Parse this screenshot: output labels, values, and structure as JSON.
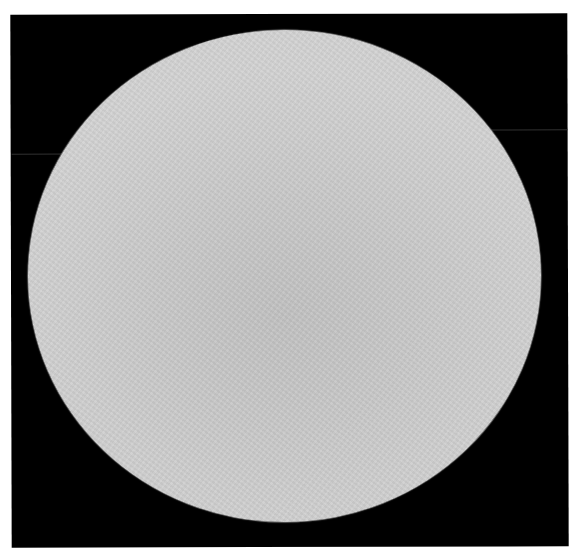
{
  "image": {
    "kind": "grayscale photograph",
    "subject": "light gray circular disc on black square background",
    "background_color": "#ffffff",
    "frame": {
      "color": "#000000",
      "left": 11,
      "top": 14,
      "width": 557,
      "height": 533
    },
    "disc": {
      "center_x": 285,
      "center_y": 276,
      "width": 513,
      "height": 492,
      "center_color": "#c3c3c3",
      "edge_color": "#d4d4d4"
    },
    "streaks": [
      {
        "side": "left",
        "y": 153,
        "x_start": 12,
        "x_end": 72,
        "color": "#3a3a3a"
      },
      {
        "side": "right",
        "y": 130,
        "x_start": 491,
        "x_end": 567,
        "color": "#3a3a3a"
      }
    ]
  }
}
